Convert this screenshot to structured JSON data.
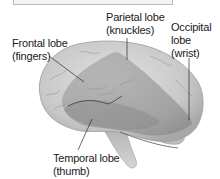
{
  "figure": {
    "labels": [
      {
        "id": "frontal",
        "name": "Frontal lobe",
        "analogy": "(fingers)"
      },
      {
        "id": "parietal",
        "name": "Parietal lobe",
        "analogy": "(knuckles)"
      },
      {
        "id": "occipital",
        "name_line1": "Occipital",
        "name_line2": "lobe",
        "analogy": "(wrist)"
      },
      {
        "id": "temporal",
        "name": "Temporal lobe",
        "analogy": "(thumb)"
      }
    ],
    "colors": {
      "brain_light": "#d4d4d4",
      "brain_mid": "#a9a9a9",
      "hand_overlay": "#8a8a8a",
      "leader_line": "#2a2a2a",
      "text": "#1a1a1a"
    }
  }
}
